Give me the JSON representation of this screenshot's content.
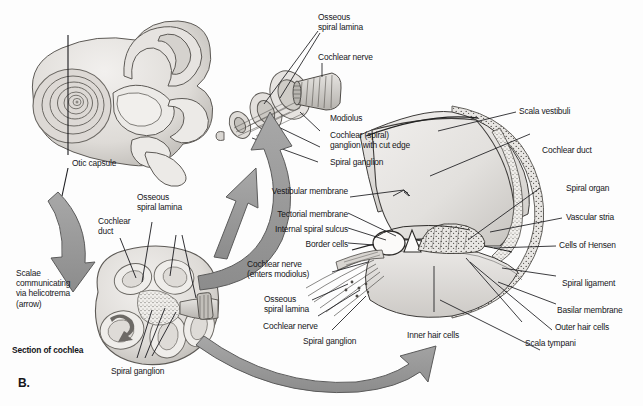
{
  "figure": {
    "panel_letter": "B.",
    "colors": {
      "background": "#fdfdfd",
      "ink": "#16161a",
      "arrow_fill": "#969696",
      "arrow_stroke": "#4a4a4a",
      "tissue_light": "#e3e1de",
      "tissue_mid": "#c9c6c2",
      "tissue_dark": "#9d9a95",
      "leader_line": "#16161a"
    }
  },
  "labels": {
    "otic_capsule": "Otic capsule",
    "osseous_spiral_lamina_top": "Osseous\nspiral lamina",
    "cochlear_nerve_top": "Cochlear nerve",
    "modiolus": "Modiolus",
    "cochlear_spiral_ganglion_cut_edge": "Cochlear (spiral)\nganglion with cut edge",
    "spiral_ganglion_mid": "Spiral ganglion",
    "scalae_communicating": "Scalae\ncommunicating\nvia helicotrema\n(arrow)",
    "section_of_cochlea": "Section of cochlea",
    "osseous_spiral_lamina_section": "Osseous\nspiral lamina",
    "cochlear_duct_section": "Cochlear\nduct",
    "spiral_ganglion_section": "Spiral ganglion",
    "vestibular_membrane": "Vestibular membrane",
    "tectorial_membrane": "Tectorial membrane",
    "internal_spiral_sulcus": "Internal spiral sulcus",
    "border_cells": "Border cells",
    "cochlear_nerve_enters_modiolus": "Cochlear nerve\n(enters modiolus)",
    "osseous_spiral_lamina_detail": "Osseous\nspiral lamina",
    "cochlear_nerve_detail": "Cochlear nerve",
    "spiral_ganglion_detail": "Spiral ganglion",
    "inner_hair_cells": "Inner hair cells",
    "scala_vestibuli": "Scala vestibuli",
    "cochlear_duct_right": "Cochlear duct",
    "spiral_organ": "Spiral organ",
    "vascular_stria": "Vascular stria",
    "cells_of_hensen": "Cells of Hensen",
    "spiral_ligament": "Spiral ligament",
    "basilar_membrane": "Basilar membrane",
    "outer_hair_cells": "Outer hair cells",
    "scala_tympani": "Scala tympani"
  },
  "diagram_parts": {
    "bony_labyrinth": "bony-labyrinth-with-cochlea",
    "modiolus_inset": "modiolus-cutaway-inset",
    "cochlea_section": "cochlea-midmodiolar-section",
    "cochlear_turn_detail": "cochlear-duct-cross-section-detail",
    "arrow_down_left": "curved-arrow-pointing-down-left",
    "arrow_up_right": "straight-arrow-pointing-up-right",
    "arrow_curve_right": "curved-arrow-sweeping-right",
    "arrow_curve_bottom": "curved-arrow-sweeping-bottom-right"
  }
}
